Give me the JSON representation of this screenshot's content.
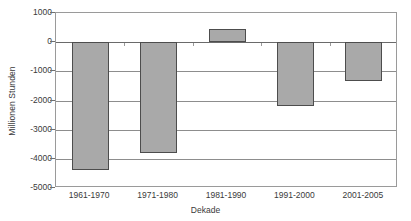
{
  "chart_data": {
    "type": "bar",
    "title": "",
    "xlabel": "Dekade",
    "ylabel": "Millionen Stunden",
    "categories": [
      "1961-1970",
      "1971-1980",
      "1981-1990",
      "1991-2000",
      "2001-2005"
    ],
    "values": [
      -4380,
      -3800,
      440,
      -2180,
      -1320
    ],
    "series": [
      {
        "name": "Millionen Stunden",
        "values": [
          -4380,
          -3800,
          440,
          -2180,
          -1320
        ]
      }
    ],
    "ylim": [
      -5000,
      1000
    ],
    "ytick_values": [
      1000,
      0,
      -1000,
      -2000,
      -3000,
      -4000,
      -5000
    ],
    "ytick_labels": [
      "1000",
      "0",
      "-1000",
      "-2000",
      "-3000",
      "-4000",
      "-5000"
    ],
    "ytick_step": 1000,
    "grid": true,
    "grid_axis": "y",
    "legend": false,
    "legend_position": "none",
    "bar_color": "#a9a9a9",
    "bar_border_color": "#4d4d4d",
    "grid_color": "#8d8d8d",
    "frame_color": "#9a9a9a",
    "text_color": "#3a3a3a",
    "background": "#ffffff",
    "annotations": []
  }
}
